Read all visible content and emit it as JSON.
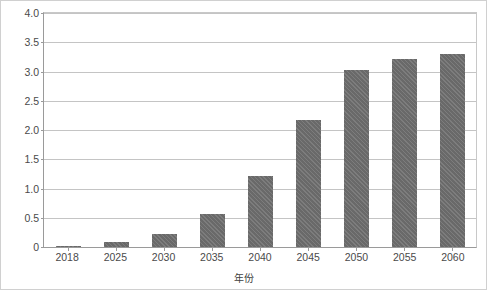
{
  "chart_data": {
    "type": "bar",
    "title": "",
    "xlabel": "年份",
    "ylabel": "用电量（万亿千瓦时）",
    "categories": [
      "2018",
      "2025",
      "2030",
      "2035",
      "2040",
      "2045",
      "2050",
      "2055",
      "2060"
    ],
    "values": [
      0.02,
      0.09,
      0.22,
      0.56,
      1.21,
      2.17,
      3.02,
      3.22,
      3.3
    ],
    "series": [
      {
        "name": "用电量",
        "values": [
          0.02,
          0.09,
          0.22,
          0.56,
          1.21,
          2.17,
          3.02,
          3.22,
          3.3
        ]
      }
    ],
    "ylim": [
      0,
      4.0
    ],
    "ytick_labels": [
      "4.0",
      "3.5",
      "3.0",
      "2.5",
      "2.0",
      "1.5",
      "1.0",
      "0.5",
      "0"
    ],
    "ytick_values": [
      4.0,
      3.5,
      3.0,
      2.5,
      2.0,
      1.5,
      1.0,
      0.5,
      0
    ],
    "grid": true,
    "legend": false,
    "legend_position": "none",
    "bar_color": "#6e6e6e",
    "grid_color": "#c4c4c4",
    "axis_color": "#9a9a9a"
  }
}
